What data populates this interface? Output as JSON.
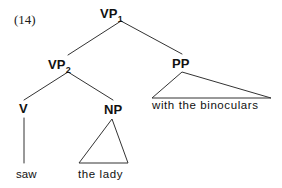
{
  "figure": {
    "example_number": "(14)",
    "background_color": "#ffffff",
    "line_color": "#333333",
    "text_color": "#111111"
  },
  "tree": {
    "nodes": [
      {
        "id": "vp1",
        "label": "VP",
        "subscript": "1",
        "x": 121,
        "y": 21
      },
      {
        "id": "vp2",
        "label": "VP",
        "subscript": "2",
        "x": 68,
        "y": 72
      },
      {
        "id": "pp",
        "label": "PP",
        "subscript": "",
        "x": 182,
        "y": 71
      },
      {
        "id": "v",
        "label": "V",
        "subscript": "",
        "x": 24,
        "y": 116
      },
      {
        "id": "np",
        "label": "NP",
        "subscript": "",
        "x": 113,
        "y": 117
      }
    ],
    "terminals": [
      {
        "id": "saw",
        "text": "saw",
        "x": 16,
        "y": 170
      },
      {
        "id": "the-lady",
        "text": "the lady",
        "x": 78,
        "y": 170
      },
      {
        "id": "with-the-binoculars",
        "text": "with the binoculars",
        "x": 152,
        "y": 101
      }
    ],
    "edges": [
      {
        "from": "vp1",
        "to": "vp2",
        "x1": 121,
        "y1": 21,
        "x2": 68,
        "y2": 55
      },
      {
        "from": "vp1",
        "to": "pp",
        "x1": 121,
        "y1": 21,
        "x2": 182,
        "y2": 54
      },
      {
        "from": "vp2",
        "to": "v",
        "x1": 68,
        "y1": 72,
        "x2": 24,
        "y2": 100
      },
      {
        "from": "vp2",
        "to": "np",
        "x1": 68,
        "y1": 72,
        "x2": 113,
        "y2": 100
      },
      {
        "from": "v",
        "to": "saw",
        "x1": 24,
        "y1": 118,
        "x2": 24,
        "y2": 163
      }
    ],
    "triangles": [
      {
        "id": "np-triangle",
        "covers": "the lady",
        "apex_x": 112,
        "apex_y": 119,
        "left_x": 79,
        "left_y": 163,
        "right_x": 128,
        "right_y": 163
      },
      {
        "id": "pp-triangle",
        "covers": "with the binoculars",
        "apex_x": 182,
        "apex_y": 72,
        "left_x": 152,
        "left_y": 98,
        "right_x": 271,
        "right_y": 98
      }
    ]
  }
}
